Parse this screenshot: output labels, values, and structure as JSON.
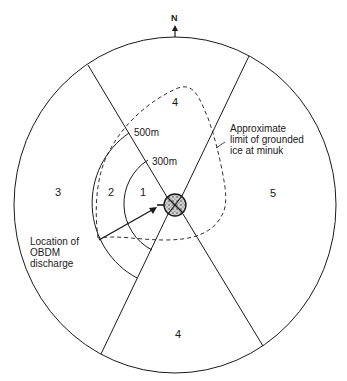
{
  "north_label": "N",
  "zones": {
    "top": "4",
    "left": "3",
    "ring_outer": "2",
    "ring_inner": "1",
    "right": "5",
    "bottom": "4"
  },
  "distances": {
    "outer_arc": "500m",
    "inner_arc": "300m"
  },
  "annotations": {
    "ice_limit": "Approximate\nlimit of grounded\nice at minuk",
    "discharge": "Location of\nOBDM\ndischarge"
  },
  "colors": {
    "line": "#1a1a1a",
    "background": "#ffffff"
  }
}
